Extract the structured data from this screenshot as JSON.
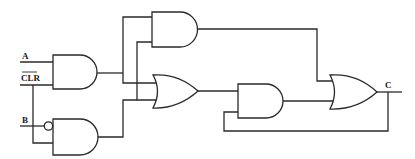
{
  "diagram": {
    "type": "logic-circuit",
    "labels": {
      "input_a": "A",
      "input_clr": "CLR",
      "input_b": "B",
      "output_c": "C"
    },
    "gates": [
      {
        "id": "and1",
        "type": "AND",
        "inputs": [
          "A",
          "CLR"
        ]
      },
      {
        "id": "and2",
        "type": "AND",
        "inputs": [
          "NOT B",
          "CLR"
        ]
      },
      {
        "id": "and3",
        "type": "AND",
        "inputs": [
          "and1",
          "and2"
        ]
      },
      {
        "id": "or1",
        "type": "OR",
        "inputs": [
          "and1",
          "and3",
          "and2"
        ]
      },
      {
        "id": "and4",
        "type": "AND",
        "inputs": [
          "or1",
          "C"
        ]
      },
      {
        "id": "or2",
        "type": "OR",
        "inputs": [
          "and3",
          "and4"
        ],
        "output": "C"
      }
    ],
    "colors": {
      "line": "#2a2a2a",
      "background": "#ffffff"
    }
  }
}
